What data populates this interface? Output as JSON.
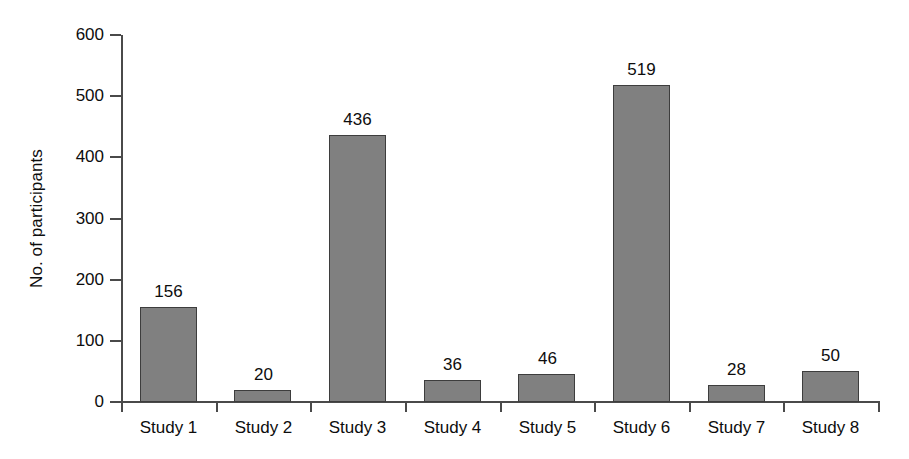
{
  "chart_data": {
    "type": "bar",
    "title": "",
    "subtitle": "",
    "xlabel": "",
    "ylabel": "No. of participants",
    "categories": [
      "Study 1",
      "Study 2",
      "Study 3",
      "Study 4",
      "Study 5",
      "Study 6",
      "Study 7",
      "Study 8"
    ],
    "values": [
      156,
      20,
      436,
      36,
      46,
      519,
      28,
      50
    ],
    "data_labels": [
      "156",
      "20",
      "436",
      "36",
      "46",
      "519",
      "28",
      "50"
    ],
    "ylim": [
      0,
      600
    ],
    "ytick_values": [
      0,
      100,
      200,
      300,
      400,
      500,
      600
    ],
    "ytick_labels": [
      "0",
      "100",
      "200",
      "300",
      "400",
      "500",
      "600"
    ],
    "grid": false,
    "legend": null,
    "legend_position": "none",
    "orientation": "vertical",
    "colors": {
      "bar_fill": "#808080",
      "bar_border": "#3d3d3d",
      "axis": "#4a4a4a",
      "text": "#0d0d0d",
      "background": "#ffffff"
    }
  },
  "axes": {
    "y_title": "No. of participants"
  }
}
